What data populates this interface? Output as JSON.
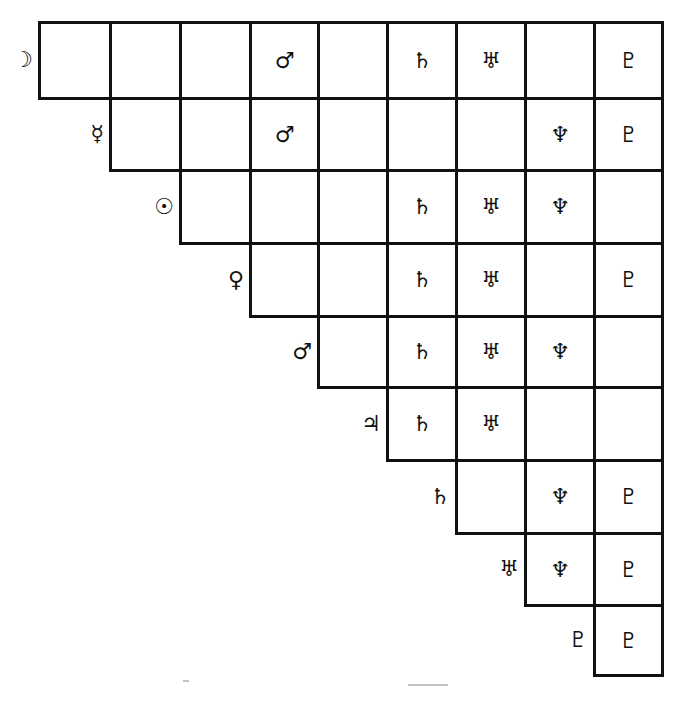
{
  "diagram": {
    "type": "triangular aspect grid",
    "glyph_map": {
      "moon": "☽",
      "mercury": "☿",
      "sun": "☉",
      "venus": "♀",
      "mars": "♂",
      "jupiter": "♃",
      "saturn": "♄",
      "uranus": "♅",
      "neptune": "♆",
      "pluto": "♇"
    },
    "column_x": [
      39,
      110,
      180,
      250,
      318,
      387,
      456,
      525,
      594,
      662
    ],
    "row_y": [
      22,
      98,
      170,
      243,
      316,
      387,
      460,
      533,
      605,
      675
    ],
    "rows": [
      {
        "label": "☽",
        "label_name": "moon",
        "start_col": 0,
        "cells": [
          "",
          "",
          "",
          "♂",
          "",
          "♄",
          "♅",
          "",
          "♇"
        ]
      },
      {
        "label": "☿",
        "label_name": "mercury",
        "start_col": 1,
        "cells": [
          "",
          "",
          "♂",
          "",
          "",
          "",
          "♆",
          "♇"
        ]
      },
      {
        "label": "☉",
        "label_name": "sun",
        "start_col": 2,
        "cells": [
          "",
          "",
          "",
          "♄",
          "♅",
          "♆",
          ""
        ]
      },
      {
        "label": "♀",
        "label_name": "venus",
        "start_col": 3,
        "cells": [
          "",
          "",
          "♄",
          "♅",
          "",
          "♇"
        ]
      },
      {
        "label": "♂",
        "label_name": "mars",
        "start_col": 4,
        "cells": [
          "",
          "♄",
          "♅",
          "♆",
          ""
        ]
      },
      {
        "label": "♃",
        "label_name": "jupiter",
        "start_col": 5,
        "cells": [
          "♄",
          "♅",
          "",
          ""
        ]
      },
      {
        "label": "♄",
        "label_name": "saturn",
        "start_col": 6,
        "cells": [
          "",
          "♆",
          "♇"
        ]
      },
      {
        "label": "♅",
        "label_name": "uranus",
        "start_col": 7,
        "cells": [
          "♆",
          "♇"
        ]
      },
      {
        "label": "♇",
        "label_name": "pluto",
        "start_col": 8,
        "cells": [
          "♇"
        ]
      }
    ]
  }
}
